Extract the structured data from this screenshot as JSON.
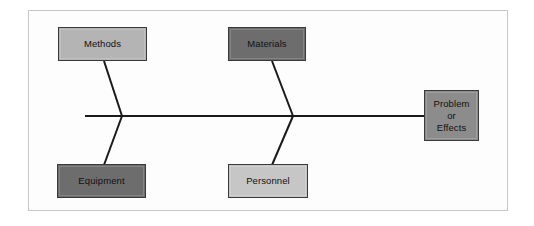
{
  "diagram": {
    "type": "fishbone-ishikawa",
    "title": "",
    "frame": {
      "border_color": "#c8c6c4",
      "background_color": "#fdfdfd",
      "x": 28,
      "y": 10,
      "width": 480,
      "height": 201
    },
    "spine": {
      "name": "spine",
      "color": "#1a1a1a",
      "x1": 85,
      "y1": 116,
      "x2": 426,
      "y2": 116,
      "thickness": 2
    },
    "ribs": [
      {
        "name": "rib-methods",
        "x1": 122,
        "y1": 116,
        "x2": 104,
        "y2": 61,
        "color": "#1a1a1a"
      },
      {
        "name": "rib-equipment",
        "x1": 122,
        "y1": 116,
        "x2": 104,
        "y2": 165,
        "color": "#1a1a1a"
      },
      {
        "name": "rib-materials",
        "x1": 293,
        "y1": 116,
        "x2": 272,
        "y2": 61,
        "color": "#1a1a1a"
      },
      {
        "name": "rib-personnel",
        "x1": 293,
        "y1": 116,
        "x2": 272,
        "y2": 165,
        "color": "#1a1a1a"
      }
    ],
    "nodes": [
      {
        "id": "methods",
        "label": "Methods",
        "role": "cause-category",
        "position": "upper-left",
        "fill": "#b4b4b4",
        "border": "#3a3a3a",
        "text_color": "#111111",
        "x": 58,
        "y": 27,
        "width": 89,
        "height": 34
      },
      {
        "id": "materials",
        "label": "Materials",
        "role": "cause-category",
        "position": "upper-middle",
        "fill": "#6d6d6d",
        "border": "#3a3a3a",
        "text_color": "#111111",
        "x": 228,
        "y": 27,
        "width": 78,
        "height": 34
      },
      {
        "id": "equipment",
        "label": "Equipment",
        "role": "cause-category",
        "position": "lower-left",
        "fill": "#6d6d6d",
        "border": "#3a3a3a",
        "text_color": "#111111",
        "x": 57,
        "y": 164,
        "width": 89,
        "height": 34
      },
      {
        "id": "personnel",
        "label": "Personnel",
        "role": "cause-category",
        "position": "lower-middle",
        "fill": "#c6c6c6",
        "border": "#3a3a3a",
        "text_color": "#111111",
        "x": 228,
        "y": 164,
        "width": 80,
        "height": 34
      },
      {
        "id": "problem-or-effects",
        "label": "Problem\nor\nEffects",
        "role": "effect-head",
        "position": "right-head",
        "fill": "#8c8c8c",
        "border": "#3a3a3a",
        "text_color": "#111111",
        "x": 424,
        "y": 90,
        "width": 55,
        "height": 51
      }
    ],
    "colors": {
      "line": "#1a1a1a",
      "light_gray_fill": "#b4b4b4",
      "lighter_gray_fill": "#c6c6c6",
      "dark_gray_fill": "#6d6d6d",
      "mid_gray_fill": "#8c8c8c",
      "frame_border": "#c8c6c4",
      "page_background": "#ffffff"
    }
  }
}
